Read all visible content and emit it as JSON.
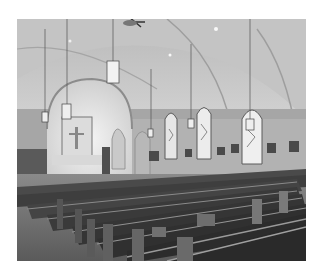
{
  "image": {
    "description": "Black-and-white photograph of a church interior with vaulted ceiling, hanging lanterns, stained glass windows and rows of wooden pews",
    "colors": {
      "background": "#ffffff",
      "ceiling": "#c8c8c8",
      "wall": "#a8a8a8",
      "pew": "#3a3a3a",
      "floor": "#6a6a6a",
      "window": "#e8e8e8"
    }
  }
}
